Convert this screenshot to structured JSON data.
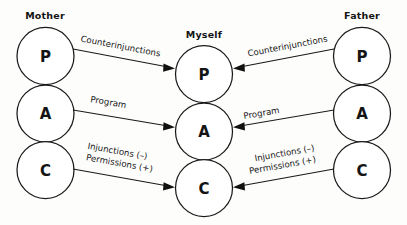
{
  "diagram": {
    "background_color": "#fdfdfc",
    "stroke_color": "#1a1a1a",
    "text_color": "#141414",
    "columns": [
      {
        "id": "mother",
        "title": "Mother",
        "ego_states": [
          {
            "id": "mother-p",
            "letter": "P"
          },
          {
            "id": "mother-a",
            "letter": "A"
          },
          {
            "id": "mother-c",
            "letter": "C"
          }
        ]
      },
      {
        "id": "myself",
        "title": "Myself",
        "ego_states": [
          {
            "id": "myself-p",
            "letter": "P"
          },
          {
            "id": "myself-a",
            "letter": "A"
          },
          {
            "id": "myself-c",
            "letter": "C"
          }
        ]
      },
      {
        "id": "father",
        "title": "Father",
        "ego_states": [
          {
            "id": "father-p",
            "letter": "P"
          },
          {
            "id": "father-a",
            "letter": "A"
          },
          {
            "id": "father-c",
            "letter": "C"
          }
        ]
      }
    ],
    "arrows": [
      {
        "id": "mother-p-to-myself-p",
        "from": "mother-p",
        "to": "myself-p",
        "direction": "left-to-right",
        "label_lines": [
          "Counterinjunctions"
        ]
      },
      {
        "id": "mother-a-to-myself-a",
        "from": "mother-a",
        "to": "myself-a",
        "direction": "left-to-right",
        "label_lines": [
          "Program"
        ]
      },
      {
        "id": "mother-c-to-myself-c",
        "from": "mother-c",
        "to": "myself-c",
        "direction": "left-to-right",
        "label_lines": [
          "Injunctions (–)",
          "Permissions (+)"
        ]
      },
      {
        "id": "father-p-to-myself-p",
        "from": "father-p",
        "to": "myself-p",
        "direction": "right-to-left",
        "label_lines": [
          "Counterinjunctions"
        ]
      },
      {
        "id": "father-a-to-myself-a",
        "from": "father-a",
        "to": "myself-a",
        "direction": "right-to-left",
        "label_lines": [
          "Program"
        ]
      },
      {
        "id": "father-c-to-myself-c",
        "from": "father-c",
        "to": "myself-c",
        "direction": "right-to-left",
        "label_lines": [
          "Injunctions (–)",
          "Permissions (+)"
        ]
      }
    ]
  }
}
